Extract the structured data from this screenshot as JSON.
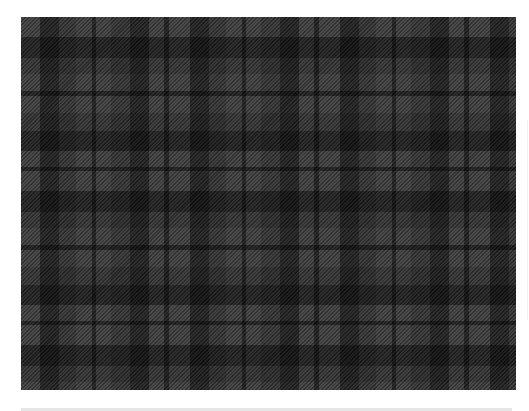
{
  "image": {
    "subject": "grey and black tartan plaid fabric",
    "colors": {
      "page_background": "#ffffff",
      "base_grey": "#454545",
      "mid_grey": "#2f2f2f",
      "black": "#080808",
      "bottom_bar": "#e6e6e6"
    },
    "sett_px": {
      "horizontal": 150,
      "vertical": 154
    },
    "thin_line_positions_x": [
      94,
      167,
      242,
      317,
      392,
      467
    ],
    "thin_line_positions_y": [
      94,
      171,
      248,
      324
    ]
  }
}
